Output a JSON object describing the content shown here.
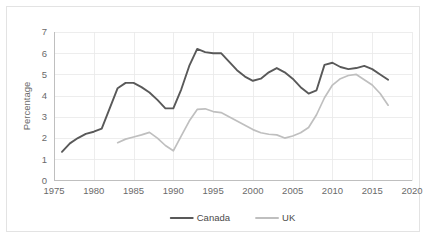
{
  "chart_data": {
    "type": "line",
    "title": "",
    "subtitle": "",
    "xlabel": "",
    "ylabel": "Percentage",
    "xlim": [
      1975,
      2020
    ],
    "ylim": [
      0,
      7
    ],
    "xticks": [
      "1975",
      "1980",
      "1985",
      "1990",
      "1995",
      "2000",
      "2005",
      "2010",
      "2015",
      "2020"
    ],
    "xtick_values": [
      1975,
      1980,
      1985,
      1990,
      1995,
      2000,
      2005,
      2010,
      2015,
      2020
    ],
    "yticks": [
      "0",
      "1",
      "2",
      "3",
      "4",
      "5",
      "6",
      "7"
    ],
    "ytick_values": [
      0,
      1,
      2,
      3,
      4,
      5,
      6,
      7
    ],
    "grid": true,
    "legend_position": "bottom",
    "series": [
      {
        "name": "Canada",
        "color": "#595959",
        "x": [
          1976,
          1977,
          1978,
          1979,
          1980,
          1981,
          1982,
          1983,
          1984,
          1985,
          1986,
          1987,
          1988,
          1989,
          1990,
          1991,
          1992,
          1993,
          1994,
          1995,
          1996,
          1997,
          1998,
          1999,
          2000,
          2001,
          2002,
          2003,
          2004,
          2005,
          2006,
          2007,
          2008,
          2009,
          2010,
          2011,
          2012,
          2013,
          2014,
          2015,
          2016,
          2017
        ],
        "values": [
          1.35,
          1.75,
          2.0,
          2.2,
          2.3,
          2.45,
          3.4,
          4.35,
          4.6,
          4.6,
          4.4,
          4.15,
          3.8,
          3.4,
          3.4,
          4.3,
          5.4,
          6.2,
          6.05,
          6.0,
          6.0,
          5.6,
          5.2,
          4.9,
          4.7,
          4.8,
          5.1,
          5.3,
          5.1,
          4.8,
          4.4,
          4.1,
          4.25,
          5.45,
          5.55,
          5.35,
          5.25,
          5.3,
          5.4,
          5.25,
          5.0,
          4.75
        ]
      },
      {
        "name": "UK",
        "color": "#bfbfbf",
        "x": [
          1983,
          1984,
          1985,
          1986,
          1987,
          1988,
          1989,
          1990,
          1991,
          1992,
          1993,
          1994,
          1995,
          1996,
          1997,
          1998,
          1999,
          2000,
          2001,
          2002,
          2003,
          2004,
          2005,
          2006,
          2007,
          2008,
          2009,
          2010,
          2011,
          2012,
          2013,
          2014,
          2015,
          2016,
          2017
        ],
        "values": [
          1.78,
          1.95,
          2.05,
          2.15,
          2.27,
          2.0,
          1.65,
          1.4,
          2.1,
          2.8,
          3.35,
          3.38,
          3.25,
          3.2,
          3.0,
          2.8,
          2.6,
          2.4,
          2.25,
          2.18,
          2.15,
          2.0,
          2.1,
          2.25,
          2.5,
          3.1,
          3.9,
          4.5,
          4.8,
          4.95,
          5.0,
          4.75,
          4.5,
          4.1,
          3.55
        ]
      }
    ],
    "legend": [
      {
        "label": "Canada",
        "color": "#595959"
      },
      {
        "label": "UK",
        "color": "#bfbfbf"
      }
    ]
  }
}
